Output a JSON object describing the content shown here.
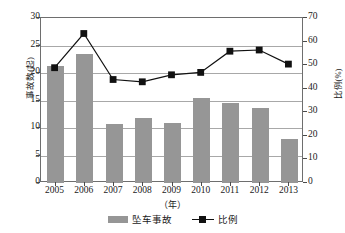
{
  "chart_data": {
    "type": "bar",
    "title": "",
    "categories": [
      "2005",
      "2006",
      "2007",
      "2008",
      "2009",
      "2010",
      "2011",
      "2012",
      "2013"
    ],
    "xlabel": "（年）",
    "ylabel": "事故数(起)",
    "y2label": "比例(%)",
    "ylim": [
      0,
      30
    ],
    "y2lim": [
      0,
      70
    ],
    "yticks": [
      "0",
      "5",
      "10",
      "15",
      "20",
      "25",
      "30"
    ],
    "y2ticks": [
      "0",
      "10",
      "20",
      "30",
      "40",
      "50",
      "60",
      "70"
    ],
    "grid": true,
    "legend_position": "bottom",
    "series": [
      {
        "name": "坠车事故",
        "type": "bar",
        "axis": "left",
        "color": "#969696",
        "values": [
          21.3,
          23.4,
          10.8,
          11.8,
          10.9,
          15.5,
          14.6,
          13.7,
          8.1
        ]
      },
      {
        "name": "比例",
        "type": "line",
        "axis": "right",
        "color": "#111111",
        "marker": "square",
        "values": [
          48.5,
          63.0,
          43.5,
          42.5,
          45.5,
          46.5,
          55.5,
          56.0,
          50.0
        ]
      }
    ]
  },
  "legend": {
    "items": [
      {
        "label": "坠车事故",
        "marker": "bar-swatch"
      },
      {
        "label": "比例",
        "marker": "line-square-marker"
      }
    ]
  }
}
